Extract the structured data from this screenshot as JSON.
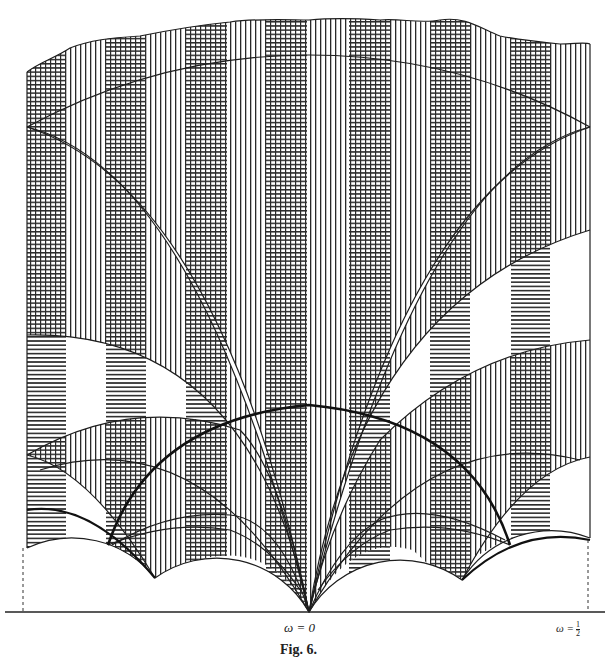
{
  "figure": {
    "caption": "Fig. 6.",
    "axis_labels": {
      "left_cusp": "ω = 0",
      "right_prefix": "ω =",
      "right_fraction_numerator": "1",
      "right_fraction_denominator": "2"
    },
    "stripe_columns_x": [
      [
        27,
        66
      ],
      [
        106,
        146
      ],
      [
        186,
        227
      ],
      [
        266,
        307
      ],
      [
        349,
        390
      ],
      [
        430,
        470
      ],
      [
        511,
        550
      ]
    ],
    "colors": {
      "ink": "#1a1a1a",
      "paper": "#ffffff"
    }
  }
}
